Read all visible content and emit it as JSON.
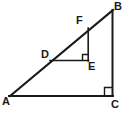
{
  "figure": {
    "kind": "geometry-diagram",
    "stroke_color": "#1a1a1a",
    "fill_color": "#ffffff",
    "background_color": "#ffffff",
    "labels": {
      "A": "A",
      "B": "B",
      "C": "C",
      "D": "D",
      "E": "E",
      "F": "F"
    },
    "points": {
      "A": {
        "x": 10,
        "y": 96
      },
      "B": {
        "x": 113,
        "y": 10
      },
      "C": {
        "x": 113,
        "y": 96
      },
      "D": {
        "x": 50,
        "y": 60
      },
      "E": {
        "x": 88,
        "y": 61
      },
      "F": {
        "x": 88,
        "y": 28
      }
    },
    "segments": [
      {
        "name": "AB",
        "from": "A",
        "to": "B"
      },
      {
        "name": "AC",
        "from": "A",
        "to": "C"
      },
      {
        "name": "BC",
        "from": "B",
        "to": "C"
      },
      {
        "name": "DE",
        "from": "D",
        "to": "E"
      },
      {
        "name": "FE",
        "from": "F",
        "to": "E"
      }
    ],
    "right_angles": [
      {
        "name": "angle-at-E",
        "vertex": "E",
        "size": 6
      },
      {
        "name": "angle-at-C",
        "vertex": "C",
        "size": 8
      }
    ]
  }
}
